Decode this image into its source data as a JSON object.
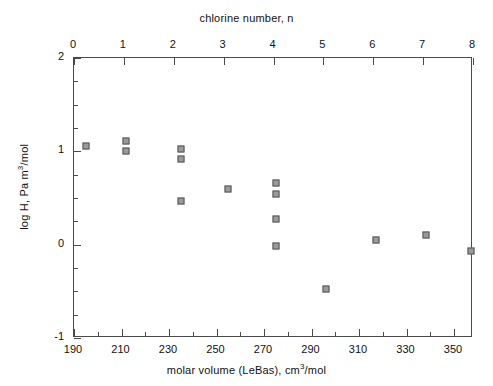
{
  "chart_data": {
    "type": "scatter",
    "title": "",
    "xlabel": "molar volume (LeBas), cm3/mol",
    "ylabel": "log H, Pa m3/mol",
    "top_axis_label": "chlorine number, n",
    "xlim": [
      190,
      358
    ],
    "ylim": [
      -1,
      2
    ],
    "top_xlim": [
      0,
      8
    ],
    "xticks": [
      190,
      210,
      230,
      250,
      270,
      290,
      310,
      330,
      350
    ],
    "xtick_labels": [
      "190",
      "210",
      "230",
      "250",
      "270",
      "290",
      "310",
      "330",
      "350"
    ],
    "yticks": [
      -1,
      0,
      1,
      2
    ],
    "ytick_labels": [
      "-1",
      "0",
      "1",
      "2"
    ],
    "top_xticks": [
      0,
      1,
      2,
      3,
      4,
      5,
      6,
      7,
      8
    ],
    "top_xtick_labels": [
      "0",
      "1",
      "2",
      "3",
      "4",
      "5",
      "6",
      "7",
      "8"
    ],
    "x_minor_interval": 10,
    "y_minor_interval": 0.25,
    "grid": false,
    "legend": false,
    "marker": "square",
    "marker_color": "#9a9a9a",
    "marker_edge_color": "#555555",
    "points": [
      {
        "x": 195,
        "y": 1.06,
        "n": 0
      },
      {
        "x": 212,
        "y": 1.11,
        "n": 1
      },
      {
        "x": 212,
        "y": 1.0,
        "n": 1
      },
      {
        "x": 235,
        "y": 1.02,
        "n": 2
      },
      {
        "x": 235,
        "y": 0.92,
        "n": 2
      },
      {
        "x": 235,
        "y": 0.47,
        "n": 2
      },
      {
        "x": 255,
        "y": 0.6,
        "n": 3
      },
      {
        "x": 275,
        "y": 0.66,
        "n": 4
      },
      {
        "x": 275,
        "y": 0.54,
        "n": 4
      },
      {
        "x": 275,
        "y": 0.28,
        "n": 4
      },
      {
        "x": 275,
        "y": -0.01,
        "n": 4
      },
      {
        "x": 296,
        "y": -0.48,
        "n": 5
      },
      {
        "x": 317,
        "y": 0.05,
        "n": 6
      },
      {
        "x": 338,
        "y": 0.1,
        "n": 7
      },
      {
        "x": 357,
        "y": -0.07,
        "n": 8
      }
    ]
  },
  "axes": {
    "bottom_title_prefix": "molar volume (LeBas), cm",
    "bottom_title_sup": "3",
    "bottom_title_suffix": "/mol",
    "y_title_prefix": "log H, Pa m",
    "y_title_sup": "3",
    "y_title_suffix": "/mol",
    "top_title": "chlorine number, n"
  }
}
